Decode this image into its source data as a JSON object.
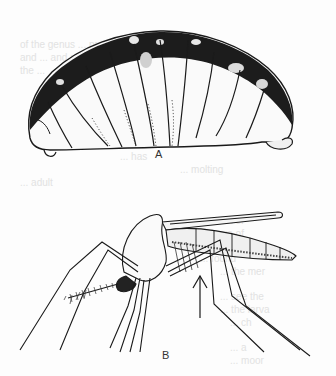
{
  "page": {
    "type": "scanned-book-page",
    "background": "#fdfdfd",
    "ink": "#222222"
  },
  "bleed_through_text": [
    "of the genus ... pre",
    "and ... and a",
    "the ...",
    "... cross",
    "... fo",
    "... has",
    "... molting",
    "... adult",
    "... most of",
    "... larva of",
    "... found",
    "... the mer",
    "... see the",
    "... the larva",
    "... ch",
    "... a",
    "... moor"
  ],
  "figures": [
    {
      "id": "A",
      "label": "A",
      "subject": "insect larva (grub), lateral view"
    },
    {
      "id": "B",
      "label": "B",
      "subject": "mosquito, lateral view",
      "annotation": "arrow-up pointing to abdomen"
    }
  ]
}
